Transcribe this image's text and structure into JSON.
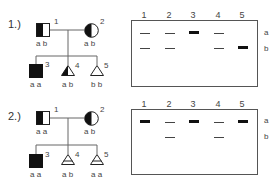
{
  "panels": [
    {
      "label": "1.)",
      "pedigree": {
        "individuals": [
          {
            "id": "1",
            "sex": "male",
            "status": "carrier",
            "genotype": "a b"
          },
          {
            "id": "2",
            "sex": "female",
            "status": "carrier",
            "genotype": "a b"
          },
          {
            "id": "3",
            "sex": "male",
            "status": "affected",
            "genotype": "a a"
          },
          {
            "id": "4",
            "sex": "unknown-fetus",
            "status": "carrier",
            "genotype": "a b"
          },
          {
            "id": "5",
            "sex": "unknown-fetus",
            "status": "unaffected",
            "genotype": "b b"
          }
        ]
      },
      "gel": {
        "lanes": [
          "1",
          "2",
          "3",
          "4",
          "5"
        ],
        "allele_labels": [
          "a",
          "b"
        ],
        "bands": [
          {
            "lane": "1",
            "a": "thin",
            "b": "thin"
          },
          {
            "lane": "2",
            "a": "thin",
            "b": "thin"
          },
          {
            "lane": "3",
            "a": "thick",
            "b": "none"
          },
          {
            "lane": "4",
            "a": "thin",
            "b": "thin"
          },
          {
            "lane": "5",
            "a": "none",
            "b": "thick"
          }
        ]
      }
    },
    {
      "label": "2.)",
      "pedigree": {
        "individuals": [
          {
            "id": "1",
            "sex": "male",
            "status": "carrier",
            "genotype": "a a"
          },
          {
            "id": "2",
            "sex": "female",
            "status": "carrier",
            "genotype": "a b"
          },
          {
            "id": "3",
            "sex": "male",
            "status": "affected",
            "genotype": "a a"
          },
          {
            "id": "4",
            "sex": "unknown-fetus",
            "status": "marked",
            "genotype": "a b"
          },
          {
            "id": "5",
            "sex": "unknown-fetus",
            "status": "marked",
            "genotype": "a a"
          }
        ]
      },
      "gel": {
        "lanes": [
          "1",
          "2",
          "3",
          "4",
          "5"
        ],
        "allele_labels": [
          "a",
          "b"
        ],
        "bands": [
          {
            "lane": "1",
            "a": "thick",
            "b": "none"
          },
          {
            "lane": "2",
            "a": "thin",
            "b": "thin"
          },
          {
            "lane": "3",
            "a": "thick",
            "b": "none"
          },
          {
            "lane": "4",
            "a": "thin",
            "b": "thin"
          },
          {
            "lane": "5",
            "a": "thick",
            "b": "none"
          }
        ]
      }
    }
  ]
}
